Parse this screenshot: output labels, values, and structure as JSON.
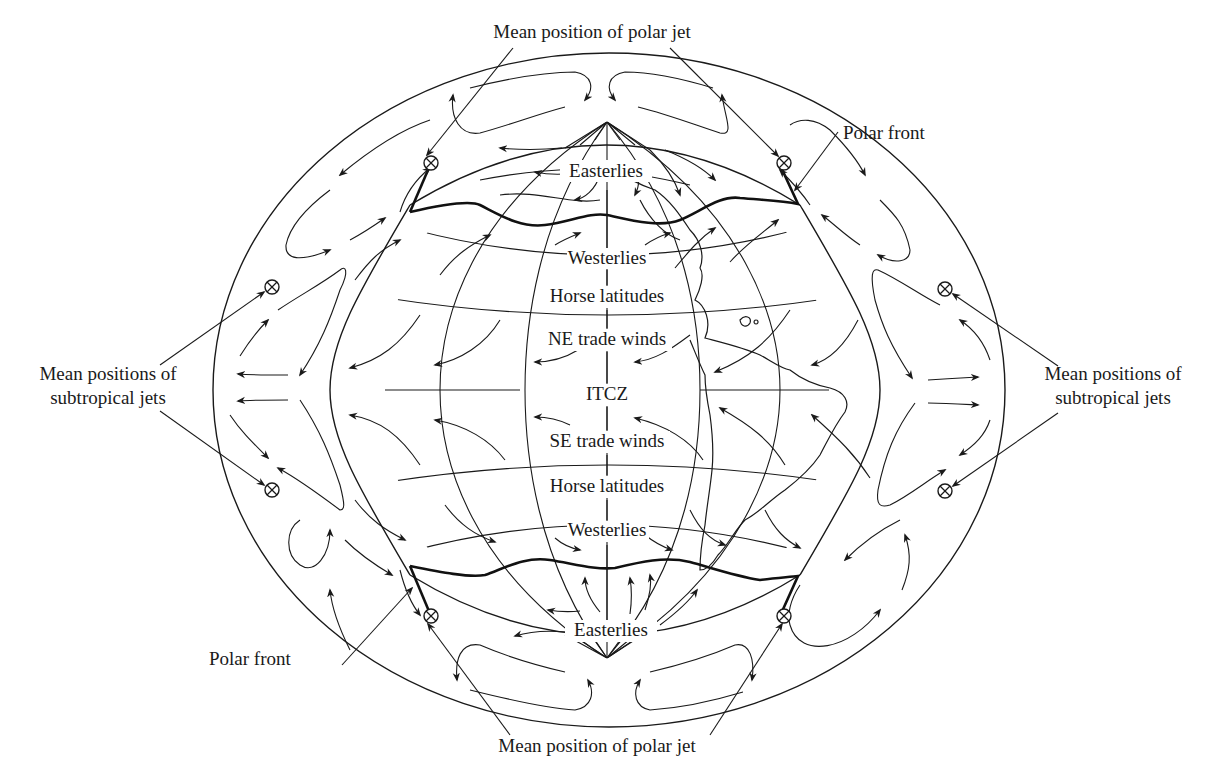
{
  "diagram": {
    "labels": {
      "polar_jet_top": "Mean position of polar jet",
      "polar_jet_bottom": "Mean position of polar jet",
      "polar_front_right": "Polar front",
      "polar_front_left": "Polar front",
      "subtropical_left_line1": "Mean positions of",
      "subtropical_left_line2": "subtropical jets",
      "subtropical_right_line1": "Mean positions of",
      "subtropical_right_line2": "subtropical jets"
    },
    "zones": [
      {
        "id": "easterlies-north",
        "label": "Easterlies",
        "x": 598,
        "y": 175
      },
      {
        "id": "westerlies-north",
        "label": "Westerlies",
        "x": 607,
        "y": 262
      },
      {
        "id": "horse-latitudes-north",
        "label": "Horse latitudes",
        "x": 607,
        "y": 300
      },
      {
        "id": "ne-trade-winds",
        "label": "NE trade winds",
        "x": 607,
        "y": 343
      },
      {
        "id": "itcz",
        "label": "ITCZ",
        "x": 607,
        "y": 397
      },
      {
        "id": "se-trade-winds",
        "label": "SE trade winds",
        "x": 607,
        "y": 444
      },
      {
        "id": "horse-latitudes-south",
        "label": "Horse latitudes",
        "x": 607,
        "y": 490
      },
      {
        "id": "westerlies-south",
        "label": "Westerlies",
        "x": 607,
        "y": 534
      },
      {
        "id": "easterlies-south",
        "label": "Easterlies",
        "x": 611,
        "y": 634
      }
    ],
    "jet_markers": [
      {
        "id": "polar-jet-nw",
        "x": 431,
        "y": 163
      },
      {
        "id": "polar-jet-ne",
        "x": 784,
        "y": 163
      },
      {
        "id": "polar-jet-sw",
        "x": 431,
        "y": 616
      },
      {
        "id": "polar-jet-se",
        "x": 784,
        "y": 616
      },
      {
        "id": "subtropical-jet-nw",
        "x": 272,
        "y": 287
      },
      {
        "id": "subtropical-jet-sw",
        "x": 272,
        "y": 490
      },
      {
        "id": "subtropical-jet-ne",
        "x": 945,
        "y": 289
      },
      {
        "id": "subtropical-jet-se",
        "x": 945,
        "y": 491
      }
    ],
    "colors": {
      "ink": "#1a1a1a",
      "background": "#ffffff"
    }
  }
}
